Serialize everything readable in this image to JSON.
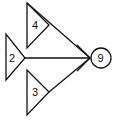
{
  "diagram": {
    "type": "flow-merge",
    "colors": {
      "stroke": "#111111",
      "background": "#ffffff"
    },
    "sources": [
      {
        "id": "top",
        "shape": "triangle",
        "label": "4"
      },
      {
        "id": "middle",
        "shape": "triangle",
        "label": "2"
      },
      {
        "id": "bottom",
        "shape": "triangle",
        "label": "3"
      }
    ],
    "target": {
      "shape": "circle",
      "label": "9"
    },
    "connector": {
      "style": "converging-lines-with-double-arrowhead"
    }
  }
}
